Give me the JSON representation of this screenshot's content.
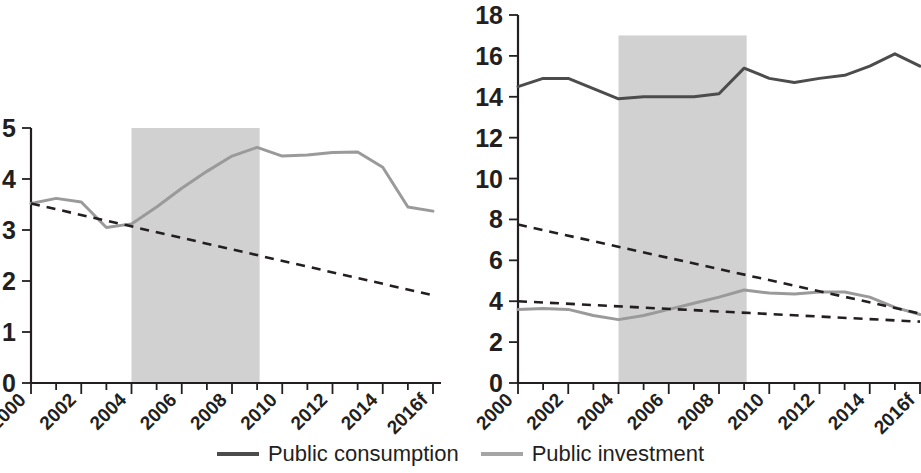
{
  "chart_data": [
    {
      "id": "left",
      "type": "line",
      "title": "",
      "xlabel": "",
      "ylabel": "",
      "ylim": [
        0,
        5
      ],
      "ytick_values": [
        0,
        1,
        2,
        3,
        4,
        5
      ],
      "ytick_labels": [
        "0",
        "1",
        "2",
        "3",
        "4",
        "5"
      ],
      "xlim": [
        2000,
        2016
      ],
      "xtick_labels": [
        "2000",
        "2002",
        "2004",
        "2006",
        "2008",
        "2010",
        "2012",
        "2014",
        "2016f"
      ],
      "xtick_values": [
        2000,
        2002,
        2004,
        2006,
        2008,
        2010,
        2012,
        2014,
        2016
      ],
      "grid": false,
      "legend_position": "bottom-shared",
      "shaded_band": {
        "x_start": 2004.0,
        "x_end": 2009.1,
        "y_top": 5.0,
        "color": "#c9c9c9"
      },
      "x": [
        2000,
        2001,
        2002,
        2003,
        2004,
        2005,
        2006,
        2007,
        2008,
        2009,
        2010,
        2011,
        2012,
        2013,
        2014,
        2015,
        2016
      ],
      "series": [
        {
          "name": "Public investment",
          "color": "#9a9a9a",
          "values": [
            3.52,
            3.62,
            3.55,
            3.05,
            3.12,
            3.45,
            3.82,
            4.15,
            4.45,
            4.62,
            4.45,
            4.47,
            4.52,
            4.53,
            4.23,
            3.45,
            3.37
          ]
        }
      ],
      "trend_lines": [
        {
          "name": "Public investment trend",
          "style": "dashed",
          "x": [
            2000,
            2016
          ],
          "values": [
            3.52,
            1.72
          ]
        }
      ]
    },
    {
      "id": "right",
      "type": "line",
      "title": "",
      "xlabel": "",
      "ylabel": "",
      "ylim": [
        0,
        18
      ],
      "ytick_values": [
        0,
        2,
        4,
        6,
        8,
        10,
        12,
        14,
        16,
        18
      ],
      "ytick_labels": [
        "0",
        "2",
        "4",
        "6",
        "8",
        "10",
        "12",
        "14",
        "16",
        "18"
      ],
      "xlim": [
        2000,
        2016
      ],
      "xtick_labels": [
        "2000",
        "2002",
        "2004",
        "2006",
        "2008",
        "2010",
        "2012",
        "2014",
        "2016f"
      ],
      "xtick_values": [
        2000,
        2002,
        2004,
        2006,
        2008,
        2010,
        2012,
        2014,
        2016
      ],
      "grid": false,
      "legend_position": "bottom-shared",
      "shaded_band": {
        "x_start": 2004.0,
        "x_end": 2009.1,
        "y_top": 17.0,
        "color": "#c9c9c9"
      },
      "x": [
        2000,
        2001,
        2002,
        2003,
        2004,
        2005,
        2006,
        2007,
        2008,
        2009,
        2010,
        2011,
        2012,
        2013,
        2014,
        2015,
        2016
      ],
      "series": [
        {
          "name": "Public consumption",
          "color": "#4c4c4c",
          "values": [
            14.5,
            14.9,
            14.9,
            14.4,
            13.9,
            14.0,
            14.0,
            14.0,
            14.15,
            15.4,
            14.9,
            14.7,
            14.9,
            15.05,
            15.5,
            16.1,
            15.5
          ]
        },
        {
          "name": "Public investment",
          "color": "#9a9a9a",
          "values": [
            3.6,
            3.65,
            3.6,
            3.3,
            3.1,
            3.3,
            3.6,
            3.9,
            4.2,
            4.55,
            4.4,
            4.35,
            4.45,
            4.45,
            4.2,
            3.7,
            3.35
          ]
        }
      ],
      "trend_lines": [
        {
          "name": "Public consumption trend",
          "style": "dashed",
          "x": [
            2000,
            2016
          ],
          "values": [
            7.75,
            3.4
          ]
        },
        {
          "name": "Public investment trend",
          "style": "dashed",
          "x": [
            2000,
            2016
          ],
          "values": [
            4.0,
            3.0
          ]
        }
      ]
    }
  ],
  "legend": {
    "items": [
      {
        "label": "Public consumption",
        "color": "#4c4c4c"
      },
      {
        "label": "Public investment",
        "color": "#9a9a9a"
      }
    ]
  }
}
